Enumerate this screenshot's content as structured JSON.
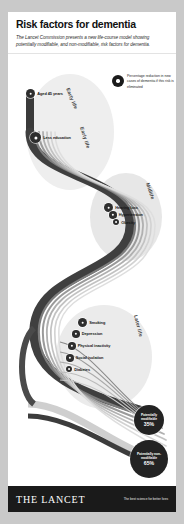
{
  "poster": {
    "title": "Risk factors for dementia",
    "subtitle": "The Lancet Commission presents a new life-course model showing potentially modifiable, and non-modifiable, risk factors for dementia."
  },
  "legend": {
    "icon": "filled-circle-marker-icon",
    "text": "Percentage reduction in new cases of dementia if this risk is eliminated"
  },
  "stages": {
    "early": "Early life",
    "early_secondary": "Early life",
    "midlife": "Midlife",
    "later": "Later life"
  },
  "risk_factors": {
    "early": [
      {
        "label": "Aged 45 years",
        "size": "md"
      },
      {
        "label": "Less education",
        "size": "lg"
      }
    ],
    "midlife": [
      {
        "label": "Hearing loss",
        "size": "md"
      },
      {
        "label": "Hypertension",
        "size": "sm"
      },
      {
        "label": "Obesity",
        "size": "xs"
      }
    ],
    "later": [
      {
        "label": "Smoking",
        "size": "md"
      },
      {
        "label": "Depression",
        "size": "sm"
      },
      {
        "label": "Physical inactivity",
        "size": "sm"
      },
      {
        "label": "Social isolation",
        "size": "sm"
      },
      {
        "label": "Diabetes",
        "size": "xs"
      }
    ]
  },
  "outcomes": [
    {
      "label": "Potentially modifiable",
      "value": "35%"
    },
    {
      "label": "Potentially non-modifiable",
      "value": "65%"
    }
  ],
  "footer": {
    "brand": "THE LANCET",
    "tagline": "The best science for better lives"
  },
  "colors": {
    "ink": "#1a1a1a",
    "node": "#2e2e2e",
    "paper": "#ffffff",
    "flow_dark": "#4a4a4a",
    "flow_light": "#d8d8d8"
  }
}
